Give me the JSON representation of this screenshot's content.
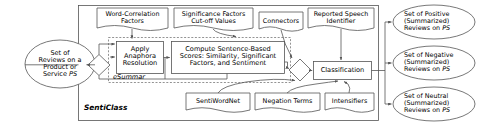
{
  "diagram": {
    "system_label": "SentiClass",
    "subsystem_label": "eSummar",
    "colors": {
      "stroke": "#555555",
      "fill": "#ffffff",
      "text": "#000000",
      "dashed_stroke": "#777777"
    },
    "input": {
      "label": "Set of\nReviews on a\nProduct or\nService PS",
      "shape": "ellipse"
    },
    "splitter": {
      "label": "",
      "shape": "diamond"
    },
    "merger": {
      "label": "",
      "shape": "diamond"
    },
    "data_stores_top": [
      {
        "label": "Word-Correlation\nFactors",
        "shape": "document"
      },
      {
        "label": "Significance Factors\nCut-off Values",
        "shape": "document"
      },
      {
        "label": "Connectors",
        "shape": "document"
      },
      {
        "label": "Reported Speech\nIdentifier",
        "shape": "document"
      }
    ],
    "data_stores_bottom": [
      {
        "label": "SentiWordNet",
        "shape": "document"
      },
      {
        "label": "Negation Terms",
        "shape": "document"
      },
      {
        "label": "Intensifiers",
        "shape": "document"
      }
    ],
    "processes": [
      {
        "label": "Apply\nAnaphora\nResolution",
        "shape": "rectangle"
      },
      {
        "label": "Compute Sentence-Based\nScores: Similarity, Significant\nFactors, and Sentiment",
        "shape": "rectangle"
      },
      {
        "label": "Classification",
        "shape": "rectangle"
      }
    ],
    "outputs": [
      {
        "label": "Set of Positive\n(Summarized)\nReviews on PS",
        "shape": "ellipse"
      },
      {
        "label": "Set of Negative\n(Summarized)\nReviews on PS",
        "shape": "ellipse"
      },
      {
        "label": "Set of Neutral\n(Summarized)\nReviews on PS",
        "shape": "ellipse"
      }
    ]
  }
}
